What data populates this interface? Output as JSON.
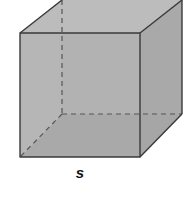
{
  "diagram": {
    "type": "cube",
    "label": "s",
    "label_position": {
      "x": 80,
      "y": 172
    },
    "colors": {
      "front_face": "#b3b3b3",
      "top_face": "#bdbdbd",
      "right_face": "#a9a9a9",
      "bottom_inner": "#9a9a9a",
      "edge": "#3a3a3a",
      "hidden_edge": "#555555"
    },
    "vertices": {
      "front_top_left": [
        20,
        33
      ],
      "front_top_right": [
        140,
        33
      ],
      "front_bottom_left": [
        20,
        157
      ],
      "front_bottom_right": [
        140,
        157
      ],
      "back_top_left": [
        62,
        0
      ],
      "back_top_right": [
        182,
        0
      ],
      "back_bottom_left": [
        62,
        114
      ],
      "back_bottom_right": [
        182,
        114
      ]
    }
  }
}
